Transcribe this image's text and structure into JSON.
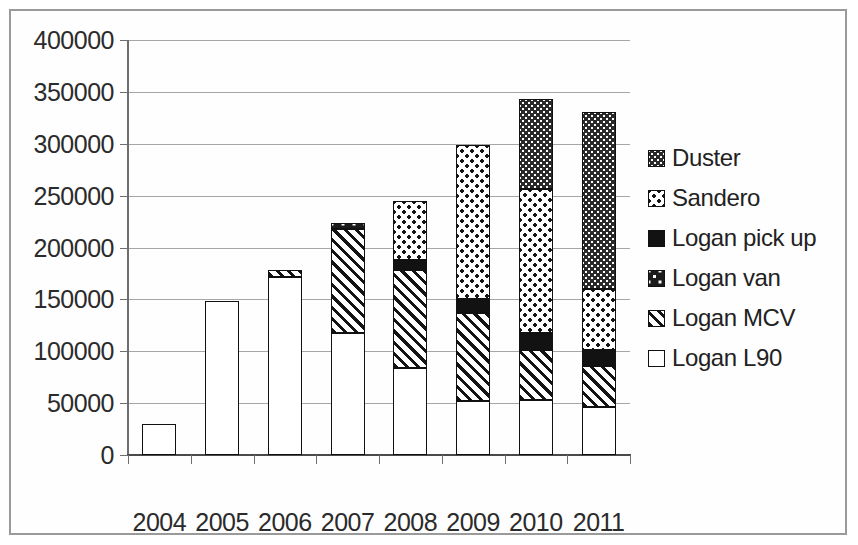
{
  "chart_data": {
    "type": "bar",
    "stacked": true,
    "title": "",
    "xlabel": "",
    "ylabel": "",
    "categories": [
      "2004",
      "2005",
      "2006",
      "2007",
      "2008",
      "2009",
      "2010",
      "2011"
    ],
    "ylim": [
      0,
      400000
    ],
    "ytick_values": [
      0,
      50000,
      100000,
      150000,
      200000,
      250000,
      300000,
      350000,
      400000
    ],
    "ytick_labels": [
      "0",
      "50000",
      "100000",
      "150000",
      "200000",
      "250000",
      "300000",
      "350000",
      "400000"
    ],
    "grid": true,
    "legend_position": "right",
    "series": [
      {
        "name": "Logan L90",
        "fill": "fill-l90",
        "values": [
          30000,
          148000,
          172000,
          118000,
          84000,
          52000,
          53000,
          46000
        ]
      },
      {
        "name": "Logan MCV",
        "fill": "fill-mcv",
        "values": [
          0,
          0,
          6000,
          100000,
          94000,
          85000,
          48000,
          40000
        ]
      },
      {
        "name": "Logan van",
        "fill": "fill-van",
        "values": [
          0,
          0,
          0,
          6000,
          0,
          0,
          0,
          0
        ]
      },
      {
        "name": "Logan pick up",
        "fill": "fill-pickup",
        "values": [
          0,
          0,
          0,
          0,
          10000,
          13000,
          17000,
          15000
        ]
      },
      {
        "name": "Sandero",
        "fill": "fill-sandero",
        "values": [
          0,
          0,
          0,
          0,
          57000,
          149000,
          138000,
          59000
        ]
      },
      {
        "name": "Duster",
        "fill": "fill-duster",
        "values": [
          0,
          0,
          0,
          0,
          0,
          0,
          87000,
          171000
        ]
      }
    ],
    "totals": [
      30000,
      148000,
      178000,
      224000,
      245000,
      299000,
      343000,
      331000
    ]
  },
  "legend": {
    "items": [
      {
        "label": "Duster",
        "fill": "fill-duster"
      },
      {
        "label": "Sandero",
        "fill": "fill-sandero"
      },
      {
        "label": "Logan pick up",
        "fill": "fill-pickup"
      },
      {
        "label": "Logan van",
        "fill": "fill-van"
      },
      {
        "label": "Logan MCV",
        "fill": "fill-mcv"
      },
      {
        "label": "Logan L90",
        "fill": "fill-l90"
      }
    ]
  },
  "colors": {
    "ink": "#1a1a1a",
    "gridline": "#a6a6a6",
    "axis": "#6e6e6e",
    "frame": "#9a9a9a",
    "background": "#ffffff"
  }
}
